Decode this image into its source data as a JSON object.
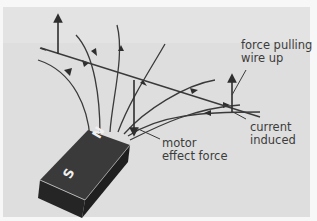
{
  "diagram": {
    "magnet": {
      "north_label": "N",
      "south_label": "S",
      "color": "#2e2e2e"
    },
    "labels": {
      "force_pulling_line1": "force pulling",
      "force_pulling_line2": "wire up",
      "current_line1": "current",
      "current_line2": "induced",
      "motor_line1": "motor",
      "motor_line2": "effect force"
    },
    "colors": {
      "background": "#dedede",
      "lines": "#3a3a3a",
      "text": "#3c3c3c"
    }
  }
}
